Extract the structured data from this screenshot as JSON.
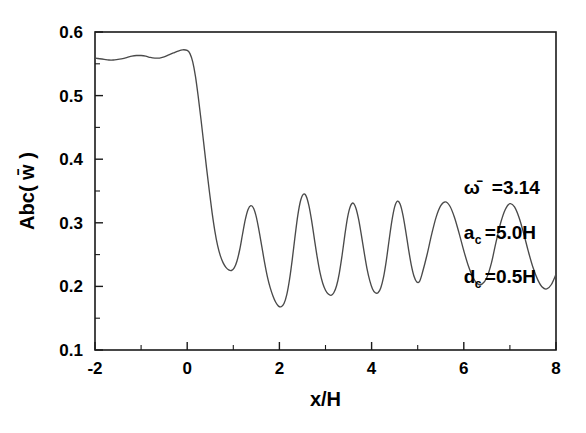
{
  "figure": {
    "background_color": "#ffffff",
    "line_color": "#4a4a4a",
    "axis_color": "#1a1a1a"
  },
  "chart_data": {
    "type": "line",
    "title": "",
    "subtitle": "",
    "xlabel": "x/H",
    "ylabel": "Abc( w̄ )",
    "xlim": [
      -2,
      8
    ],
    "ylim": [
      0.1,
      0.6
    ],
    "xticks": [
      -2,
      0,
      2,
      4,
      6,
      8
    ],
    "xtick_labels": [
      "-2",
      "0",
      "2",
      "4",
      "6",
      "8"
    ],
    "xminor_step": 1,
    "yticks": [
      0.1,
      0.2,
      0.3,
      0.4,
      0.5,
      0.6
    ],
    "ytick_labels": [
      "0.1",
      "0.2",
      "0.3",
      "0.4",
      "0.5",
      "0.6"
    ],
    "yminor_step": 0.05,
    "grid": false,
    "legend": null,
    "annotations": [
      {
        "text": "ω̄ =3.14",
        "base": "ω̄",
        "sub": "",
        "rest": " =3.14",
        "x": 6.0,
        "y": 0.345
      },
      {
        "text": "a_c =5.0H",
        "base": "a",
        "sub": "c",
        "rest": " =5.0H",
        "x": 6.0,
        "y": 0.275
      },
      {
        "text": "d_c =0.5H",
        "base": "d",
        "sub": "c",
        "rest": " =0.5H",
        "x": 6.0,
        "y": 0.205
      }
    ],
    "series": [
      {
        "name": "Abc(w̄)",
        "description": "Flat high plateau near 0.56 with small ripples outside the cavity, steep drops at x≈0.2 and x≈4.85, and seven alternating-amplitude oscillations inside the cavity.",
        "x": [
          -2.0,
          -1.9,
          -1.8,
          -1.7,
          -1.6,
          -1.5,
          -1.4,
          -1.3,
          -1.2,
          -1.1,
          -1.0,
          -0.9,
          -0.8,
          -0.7,
          -0.6,
          -0.5,
          -0.4,
          -0.3,
          -0.2,
          -0.1,
          0.0,
          0.06,
          0.12,
          0.18,
          0.24,
          0.3,
          0.36,
          0.42,
          0.48,
          0.54,
          0.6,
          0.66,
          0.72,
          0.78,
          0.84,
          0.9,
          0.96,
          1.02,
          1.08,
          1.14,
          1.2,
          1.26,
          1.32,
          1.38,
          1.44,
          1.5,
          1.56,
          1.62,
          1.68,
          1.74,
          1.8,
          1.86,
          1.92,
          1.98,
          2.04,
          2.1,
          2.16,
          2.22,
          2.28,
          2.34,
          2.4,
          2.46,
          2.52,
          2.58,
          2.64,
          2.7,
          2.76,
          2.82,
          2.88,
          2.94,
          3.0,
          3.06,
          3.12,
          3.18,
          3.24,
          3.3,
          3.36,
          3.42,
          3.48,
          3.54,
          3.6,
          3.66,
          3.72,
          3.78,
          3.84,
          3.9,
          3.96,
          4.02,
          4.08,
          4.14,
          4.2,
          4.26,
          4.32,
          4.38,
          4.44,
          4.5,
          4.56,
          4.62,
          4.68,
          4.74,
          4.8,
          4.86,
          4.92,
          4.98,
          5.04,
          5.1,
          5.2,
          5.3,
          5.4,
          5.5,
          5.6,
          5.7,
          5.8,
          5.9,
          6.0,
          6.1,
          6.2,
          6.3,
          6.4,
          6.5,
          6.6,
          6.7,
          6.8,
          6.9,
          7.0,
          7.1,
          7.2,
          7.3,
          7.4,
          7.5,
          7.6,
          7.7,
          7.8,
          7.9,
          8.0
        ],
        "y": [
          0.559,
          0.558,
          0.557,
          0.556,
          0.556,
          0.557,
          0.558,
          0.56,
          0.562,
          0.563,
          0.563,
          0.562,
          0.56,
          0.559,
          0.559,
          0.561,
          0.564,
          0.567,
          0.57,
          0.572,
          0.571,
          0.566,
          0.553,
          0.53,
          0.498,
          0.462,
          0.424,
          0.386,
          0.35,
          0.316,
          0.287,
          0.264,
          0.248,
          0.237,
          0.23,
          0.226,
          0.225,
          0.229,
          0.24,
          0.258,
          0.282,
          0.305,
          0.321,
          0.327,
          0.323,
          0.309,
          0.287,
          0.262,
          0.237,
          0.215,
          0.198,
          0.185,
          0.175,
          0.169,
          0.168,
          0.173,
          0.187,
          0.211,
          0.243,
          0.279,
          0.312,
          0.335,
          0.345,
          0.342,
          0.327,
          0.303,
          0.274,
          0.246,
          0.222,
          0.205,
          0.194,
          0.188,
          0.186,
          0.19,
          0.201,
          0.221,
          0.249,
          0.281,
          0.309,
          0.326,
          0.331,
          0.323,
          0.305,
          0.28,
          0.253,
          0.228,
          0.209,
          0.196,
          0.19,
          0.19,
          0.198,
          0.215,
          0.241,
          0.273,
          0.303,
          0.325,
          0.334,
          0.329,
          0.312,
          0.287,
          0.259,
          0.234,
          0.216,
          0.207,
          0.208,
          0.221,
          0.249,
          0.281,
          0.309,
          0.327,
          0.333,
          0.326,
          0.308,
          0.283,
          0.256,
          0.232,
          0.214,
          0.204,
          0.204,
          0.214,
          0.237,
          0.27,
          0.3,
          0.321,
          0.33,
          0.325,
          0.308,
          0.283,
          0.255,
          0.23,
          0.211,
          0.199,
          0.196,
          0.203,
          0.219
        ]
      }
    ]
  }
}
